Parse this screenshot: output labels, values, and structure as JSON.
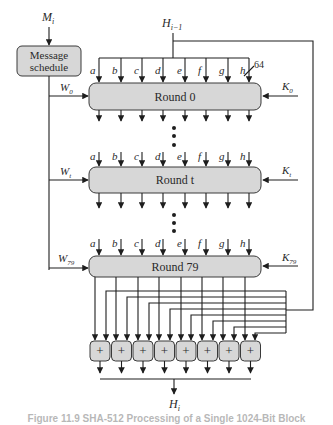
{
  "diagram": {
    "title_caption": "Figure 11.9 SHA-512 Processing of a Single 1024-Bit Block",
    "input_message_label": "M",
    "input_message_sub": "i",
    "message_schedule": {
      "line1": "Message",
      "line2": "schedule"
    },
    "prev_hash_label": "H",
    "prev_hash_sub": "i−1",
    "bus_width_label": "64",
    "output_hash_label": "H",
    "output_hash_sub": "i",
    "register_labels": [
      "a",
      "b",
      "c",
      "d",
      "e",
      "f",
      "g",
      "h"
    ],
    "rounds": [
      {
        "label": "Round 0",
        "w_label": "W",
        "w_sub": "0",
        "k_label": "K",
        "k_sub": "0"
      },
      {
        "label": "Round t",
        "w_label": "W",
        "w_sub": "t",
        "k_label": "K",
        "k_sub": "t"
      },
      {
        "label": "Round 79",
        "w_label": "W",
        "w_sub": "79",
        "k_label": "K",
        "k_sub": "79"
      }
    ],
    "adder_symbol": "+",
    "adder_count": 8,
    "colors": {
      "box_fill": "#d7d7d7",
      "line": "#1e1e1e"
    }
  }
}
